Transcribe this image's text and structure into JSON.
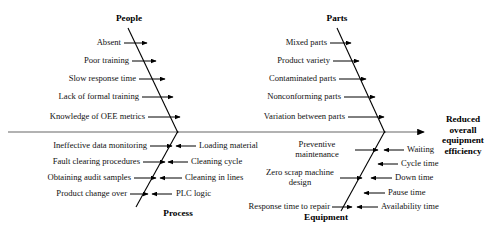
{
  "diagram": {
    "type": "fishbone-ishikawa",
    "effect": {
      "lines": [
        "Reduced",
        "overall",
        "equipment",
        "efficiency"
      ],
      "text": "Reduced overall equipment efficiency"
    },
    "categories": [
      {
        "id": "people",
        "label": "People",
        "position": "top-left",
        "causes": [
          "Absent",
          "Poor training",
          "Slow response time",
          "Lack of formal training",
          "Knowledge of OEE metrics"
        ]
      },
      {
        "id": "parts",
        "label": "Parts",
        "position": "top-right",
        "causes": [
          "Mixed parts",
          "Product variety",
          "Contaminated parts",
          "Nonconforming parts",
          "Variation between parts"
        ]
      },
      {
        "id": "process",
        "label": "Process",
        "position": "bottom-left",
        "causes_left": [
          "Ineffective data monitoring",
          "Fault clearing procedures",
          "Obtaining audit samples",
          "Product change over"
        ],
        "causes_right": [
          "Loading material",
          "Cleaning cycle",
          "Cleaning in lines",
          "PLC logic"
        ]
      },
      {
        "id": "equipment",
        "label": "Equipment",
        "position": "bottom-right",
        "causes_left": [
          "Preventive maintenance",
          "Zero scrap machine design",
          "Response time to repair"
        ],
        "causes_right": [
          "Waiting",
          "Cycle time",
          "Down time",
          "Pause time",
          "Availability time"
        ]
      }
    ],
    "colors": {
      "line": "#000000",
      "spine": "#555555",
      "text": "#111111"
    }
  }
}
